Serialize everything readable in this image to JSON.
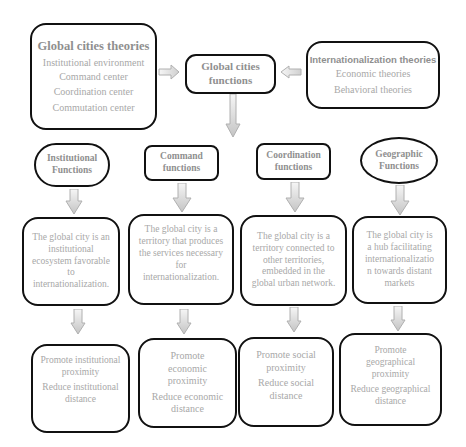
{
  "colors": {
    "border": "#111111",
    "text": "#a8a8a8",
    "title_text": "#8f8f8f",
    "arrow_fill_top": "#f4f4f4",
    "arrow_fill_bottom": "#c9c9c9",
    "arrow_stroke": "#b5b5b5"
  },
  "top": {
    "global_theories": {
      "title": "Global cities theories",
      "items": [
        "Institutional environment",
        "Command center",
        "Coordination center",
        "Commutation center"
      ]
    },
    "center": {
      "title_line1": "Global cities",
      "title_line2": "functions"
    },
    "intl_theories": {
      "title": "Internationalization theories",
      "items": [
        "Economic theories",
        "Behavioral theories"
      ]
    }
  },
  "columns": [
    {
      "header": [
        "Institutional",
        "Functions"
      ],
      "description": [
        "The global city is an",
        "institutional",
        "ecosystem favorable",
        "to",
        "internationalization."
      ],
      "outcome": [
        "Promote institutional",
        "proximity",
        "Reduce institutional",
        "distance"
      ]
    },
    {
      "header": [
        "Command",
        "functions"
      ],
      "description": [
        "The global city is a",
        "territory that produces",
        "the services necessary",
        "for",
        "internationalization."
      ],
      "outcome": [
        "Promote",
        "economic",
        "proximity",
        "Reduce economic",
        "distance"
      ]
    },
    {
      "header": [
        "Coordination",
        "functions"
      ],
      "description": [
        "The global city is a",
        "territory connected to",
        "other territories,",
        "embedded in the",
        "global urban network."
      ],
      "outcome": [
        "Promote social",
        "proximity",
        "Reduce social",
        "distance"
      ]
    },
    {
      "header": [
        "Geographic",
        "Functions"
      ],
      "description": [
        "The global city is",
        "a hub facilitating",
        "internationalizatio",
        "n towards distant",
        "markets"
      ],
      "outcome": [
        "Promote",
        "geographical",
        "proximity",
        "Reduce geographical",
        "distance"
      ]
    }
  ]
}
